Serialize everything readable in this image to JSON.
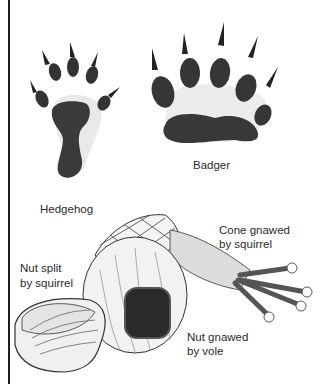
{
  "figure": {
    "labels": {
      "hedgehog": "Hedgehog",
      "badger": "Badger",
      "cone_line1": "Cone gnawed",
      "cone_line2": "by squirrel",
      "nut_split_line1": "Nut split",
      "nut_split_line2": "by squirrel",
      "nut_vole_line1": "Nut gnawed",
      "nut_vole_line2": "by vole"
    },
    "colors": {
      "ink": "#2a2a2a",
      "paper": "#ffffff",
      "stipple": "#d9d9d9"
    }
  }
}
